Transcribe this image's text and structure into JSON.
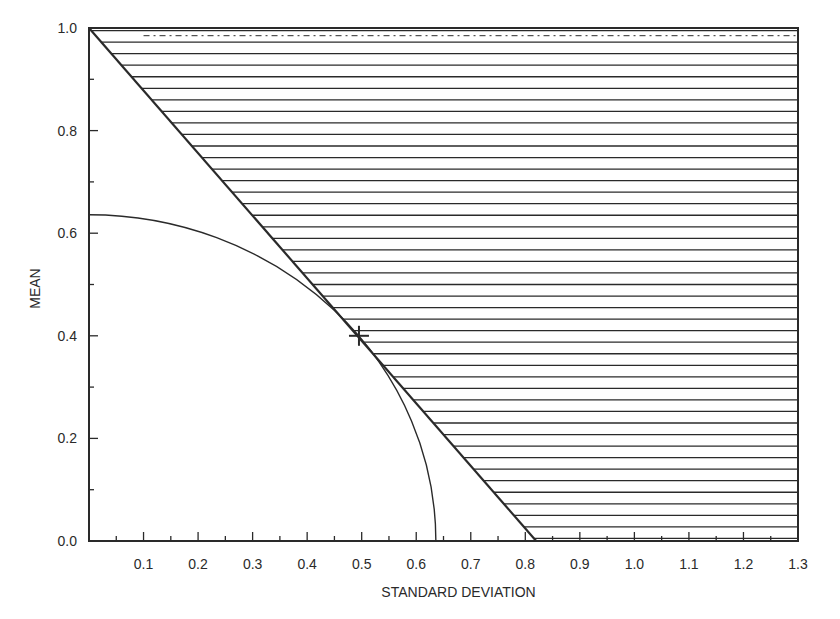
{
  "chart_data": {
    "type": "line",
    "title": "",
    "xlabel": "STANDARD DEVIATION",
    "ylabel": "MEAN",
    "xlim": [
      0.0,
      1.3
    ],
    "ylim": [
      0.0,
      1.0
    ],
    "grid": false,
    "legend": null,
    "x_ticks": [
      "0.1",
      "0.2",
      "0.3",
      "0.4",
      "0.5",
      "0.6",
      "0.7",
      "0.8",
      "0.9",
      "1.0",
      "1.1",
      "1.2",
      "1.3"
    ],
    "y_ticks": [
      "0.0",
      "0.2",
      "0.4",
      "0.6",
      "0.8",
      "1.0"
    ],
    "series": [
      {
        "name": "boundary line",
        "kind": "line",
        "points": [
          [
            0.0,
            1.0
          ],
          [
            0.82,
            0.0
          ]
        ]
      },
      {
        "name": "quarter circle",
        "kind": "arc",
        "center": [
          0.0,
          0.0
        ],
        "radius": 0.636,
        "points": [
          [
            0.0,
            0.636
          ],
          [
            0.3,
            0.561
          ],
          [
            0.45,
            0.449
          ],
          [
            0.55,
            0.319
          ],
          [
            0.6,
            0.211
          ],
          [
            0.636,
            0.0
          ]
        ]
      }
    ],
    "shaded_region": {
      "description": "horizontally hatched region above/right of boundary line",
      "bounds": "mean >= 1 - sd/0.82, up to mean 1.0, sd up to 1.3",
      "hatch": "horizontal"
    },
    "annotations": [
      {
        "marker": "+",
        "x": 0.495,
        "y": 0.4,
        "description": "tangent point"
      }
    ]
  },
  "colors": {
    "ink": "#2a2a2a",
    "background": "#ffffff"
  }
}
